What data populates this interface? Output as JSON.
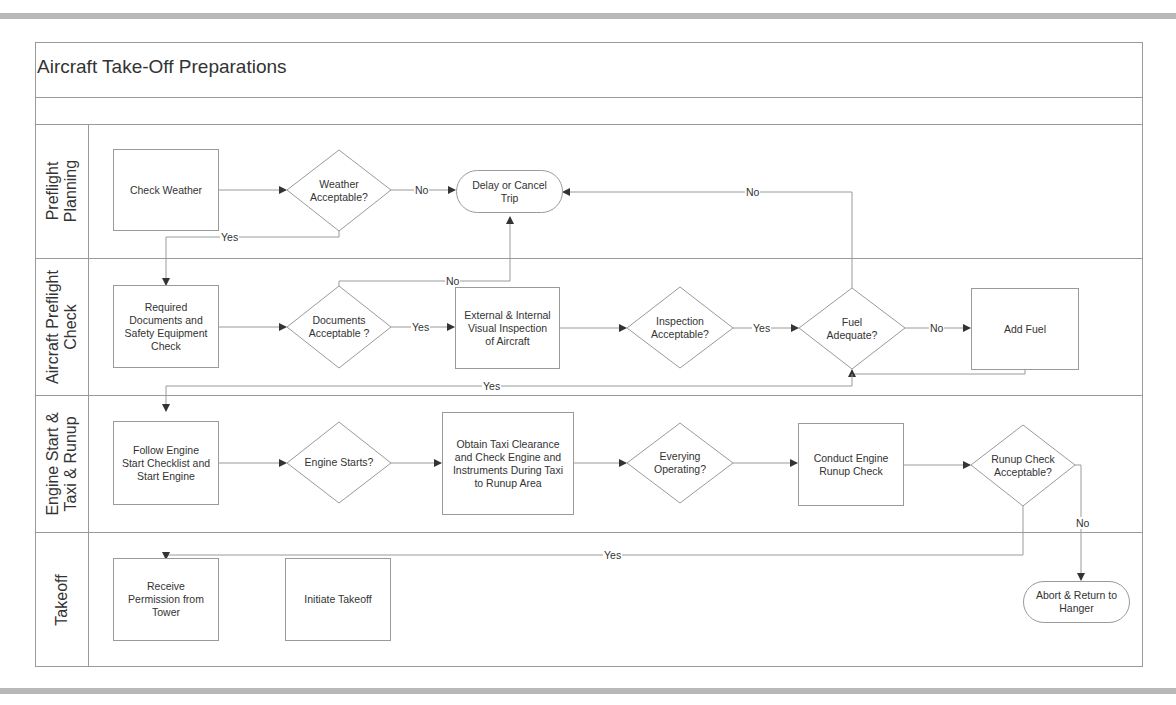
{
  "diagram": {
    "title": "Aircraft Take-Off Preparations",
    "type": "cross-functional swimlane flowchart"
  },
  "lanes": [
    {
      "id": "preflight-planning",
      "label": "Preflight\nPlanning"
    },
    {
      "id": "aircraft-preflight-check",
      "label": "Aircraft Preflight\nCheck"
    },
    {
      "id": "engine-start-taxi-runup",
      "label": "Engine Start &\nTaxi & Runup"
    },
    {
      "id": "takeoff",
      "label": "Takeoff"
    }
  ],
  "nodes": {
    "check_weather": {
      "type": "process",
      "lane": "preflight-planning",
      "text": "Check Weather"
    },
    "weather_acceptable": {
      "type": "decision",
      "lane": "preflight-planning",
      "text": "Weather\nAcceptable?"
    },
    "delay_cancel": {
      "type": "terminator",
      "lane": "preflight-planning",
      "text": "Delay or Cancel\nTrip"
    },
    "required_docs": {
      "type": "process",
      "lane": "aircraft-preflight-check",
      "text": "Required\nDocuments and\nSafety Equipment\nCheck"
    },
    "documents_acceptable": {
      "type": "decision",
      "lane": "aircraft-preflight-check",
      "text": "Documents\nAcceptable ?"
    },
    "visual_inspection": {
      "type": "process",
      "lane": "aircraft-preflight-check",
      "text": "External & Internal\nVisual Inspection\nof Aircraft"
    },
    "inspection_acceptable": {
      "type": "decision",
      "lane": "aircraft-preflight-check",
      "text": "Inspection\nAcceptable?"
    },
    "fuel_adequate": {
      "type": "decision",
      "lane": "aircraft-preflight-check",
      "text": "Fuel\nAdequate?"
    },
    "add_fuel": {
      "type": "process",
      "lane": "aircraft-preflight-check",
      "text": "Add Fuel"
    },
    "engine_start_checklist": {
      "type": "process",
      "lane": "engine-start-taxi-runup",
      "text": "Follow Engine\nStart Checklist and\nStart Engine"
    },
    "engine_starts": {
      "type": "decision",
      "lane": "engine-start-taxi-runup",
      "text": "Engine Starts?"
    },
    "taxi_clearance": {
      "type": "process",
      "lane": "engine-start-taxi-runup",
      "text": "Obtain Taxi Clearance\nand Check Engine and\nInstruments During Taxi\nto Runup Area"
    },
    "everything_operating": {
      "type": "decision",
      "lane": "engine-start-taxi-runup",
      "text": "Everying\nOperating?"
    },
    "engine_runup": {
      "type": "process",
      "lane": "engine-start-taxi-runup",
      "text": "Conduct Engine\nRunup Check"
    },
    "runup_acceptable": {
      "type": "decision",
      "lane": "engine-start-taxi-runup",
      "text": "Runup Check\nAcceptable?"
    },
    "receive_permission": {
      "type": "process",
      "lane": "takeoff",
      "text": "Receive\nPermission from\nTower"
    },
    "initiate_takeoff": {
      "type": "process",
      "lane": "takeoff",
      "text": "Initiate Takeoff"
    },
    "abort_return": {
      "type": "terminator",
      "lane": "takeoff",
      "text": "Abort & Return to\nHanger"
    }
  },
  "edges": [
    {
      "from": "check_weather",
      "to": "weather_acceptable",
      "label": ""
    },
    {
      "from": "weather_acceptable",
      "to": "delay_cancel",
      "label": "No"
    },
    {
      "from": "weather_acceptable",
      "to": "required_docs",
      "label": "Yes"
    },
    {
      "from": "required_docs",
      "to": "documents_acceptable",
      "label": ""
    },
    {
      "from": "documents_acceptable",
      "to": "delay_cancel",
      "label": "No"
    },
    {
      "from": "documents_acceptable",
      "to": "visual_inspection",
      "label": "Yes"
    },
    {
      "from": "visual_inspection",
      "to": "inspection_acceptable",
      "label": ""
    },
    {
      "from": "inspection_acceptable",
      "to": "fuel_adequate",
      "label": "Yes"
    },
    {
      "from": "fuel_adequate",
      "to": "delay_cancel",
      "label": "No"
    },
    {
      "from": "fuel_adequate",
      "to": "add_fuel",
      "label": "No"
    },
    {
      "from": "add_fuel",
      "to": "fuel_adequate",
      "label": ""
    },
    {
      "from": "fuel_adequate",
      "to": "engine_start_checklist",
      "label": "Yes"
    },
    {
      "from": "engine_start_checklist",
      "to": "engine_starts",
      "label": ""
    },
    {
      "from": "engine_starts",
      "to": "taxi_clearance",
      "label": ""
    },
    {
      "from": "taxi_clearance",
      "to": "everything_operating",
      "label": ""
    },
    {
      "from": "everything_operating",
      "to": "engine_runup",
      "label": ""
    },
    {
      "from": "engine_runup",
      "to": "runup_acceptable",
      "label": ""
    },
    {
      "from": "runup_acceptable",
      "to": "abort_return",
      "label": "No"
    },
    {
      "from": "runup_acceptable",
      "to": "receive_permission",
      "label": "Yes"
    }
  ],
  "connector_labels": {
    "weather_no": "No",
    "weather_yes": "Yes",
    "docs_no": "No",
    "docs_yes": "Yes",
    "inspection_yes": "Yes",
    "fuel_no_top": "No",
    "fuel_no_right": "No",
    "fuel_yes": "Yes",
    "runup_no": "No",
    "runup_yes": "Yes"
  },
  "colors": {
    "line": "#9a9a9a",
    "arrow": "#333333",
    "text": "#333333",
    "band": "#b8b8b8"
  }
}
